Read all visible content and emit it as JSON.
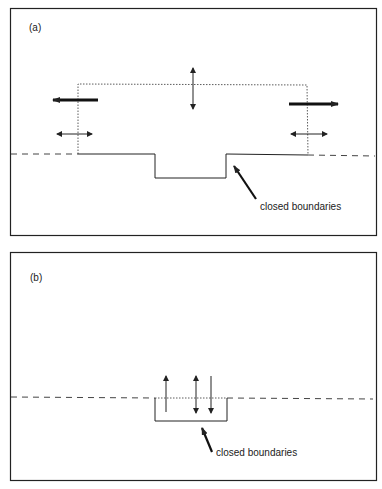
{
  "panels": [
    {
      "id": "a",
      "label": "(a)",
      "annotation": "closed boundaries"
    },
    {
      "id": "b",
      "label": "(b)",
      "annotation": "closed boundaries"
    }
  ],
  "colors": {
    "line": "#222222",
    "background": "#ffffff"
  }
}
